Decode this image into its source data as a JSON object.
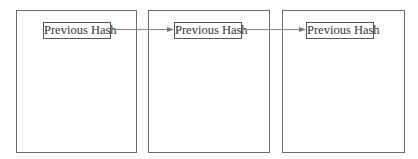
{
  "diagram": {
    "type": "blockchain",
    "blocks": [
      {
        "label": "Previous Hash"
      },
      {
        "label": "Previous Hash"
      },
      {
        "label": "Previous Hash"
      }
    ],
    "connections": [
      {
        "from": 0,
        "to": 1
      },
      {
        "from": 1,
        "to": 2
      }
    ],
    "colors": {
      "border": "#6b6b6b",
      "arrow": "#888888",
      "text": "#333333"
    }
  }
}
